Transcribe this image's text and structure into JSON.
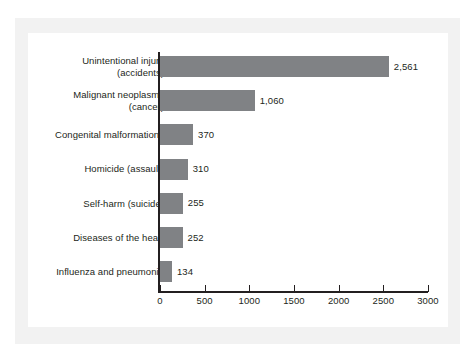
{
  "chart_data": {
    "type": "bar",
    "orientation": "horizontal",
    "title": "",
    "subtitle": "",
    "xlabel": "",
    "ylabel": "",
    "xlim": [
      0,
      3000
    ],
    "grid": false,
    "legend": null,
    "categories": [
      "Unintentional injury (accidents)",
      "Malignant neoplasms (cancer)",
      "Congenital malformations",
      "Homicide (assault)",
      "Self-harm (suicide)",
      "Diseases of the heart",
      "Influenza and pneumonia"
    ],
    "values": [
      2561,
      1060,
      370,
      310,
      255,
      252,
      134
    ],
    "value_labels": [
      "2,561",
      "1,060",
      "370",
      "310",
      "255",
      "252",
      "134"
    ],
    "xticks": [
      0,
      500,
      1000,
      1500,
      2000,
      2500,
      3000
    ],
    "xtick_labels": [
      "0",
      "500",
      "1000",
      "1500",
      "2000",
      "2500",
      "3000"
    ],
    "bar_color": "#808285",
    "axis_color": "#231f20",
    "text_color": "#231f20",
    "background": "#ffffff",
    "mat_color": "#f2f2f2"
  },
  "rows": [
    {
      "label_line1": "Unintentional injury",
      "label_line2": "(accidents)",
      "value": 2561,
      "value_label": "2,561"
    },
    {
      "label_line1": "Malignant neoplasms",
      "label_line2": "(cancer)",
      "value": 1060,
      "value_label": "1,060"
    },
    {
      "label_line1": "Congenital malformations",
      "label_line2": "",
      "value": 370,
      "value_label": "370"
    },
    {
      "label_line1": "Homicide (assault)",
      "label_line2": "",
      "value": 310,
      "value_label": "310"
    },
    {
      "label_line1": "Self-harm (suicide)",
      "label_line2": "",
      "value": 255,
      "value_label": "255"
    },
    {
      "label_line1": "Diseases of the heart",
      "label_line2": "",
      "value": 252,
      "value_label": "252"
    },
    {
      "label_line1": "Influenza and pneumonia",
      "label_line2": "",
      "value": 134,
      "value_label": "134"
    }
  ],
  "xaxis": {
    "ticks": [
      {
        "label": "0",
        "value": 0
      },
      {
        "label": "500",
        "value": 500
      },
      {
        "label": "1000",
        "value": 1000
      },
      {
        "label": "1500",
        "value": 1500
      },
      {
        "label": "2000",
        "value": 2000
      },
      {
        "label": "2500",
        "value": 2500
      },
      {
        "label": "3000",
        "value": 3000
      }
    ]
  }
}
